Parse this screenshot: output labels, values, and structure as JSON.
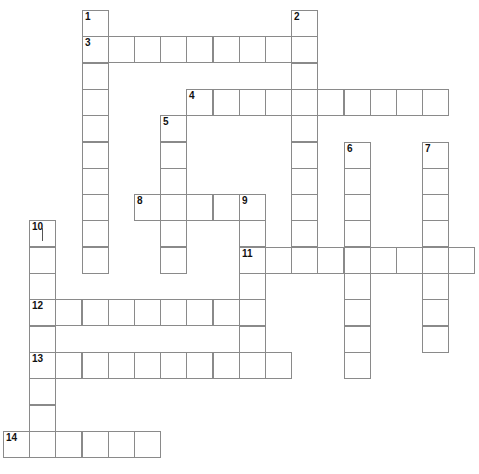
{
  "puzzle": {
    "grid": {
      "origin_x": 3,
      "origin_y": 10,
      "cell_w": 26.2,
      "cell_h": 26.3,
      "border_color": "#8a8a8a",
      "fill_color": "#ffffff"
    },
    "entries": [
      {
        "number": "1",
        "direction": "down",
        "row": 0,
        "col": 3,
        "length": 10
      },
      {
        "number": "2",
        "direction": "down",
        "row": 0,
        "col": 11,
        "length": 10
      },
      {
        "number": "3",
        "direction": "across",
        "row": 1,
        "col": 3,
        "length": 9
      },
      {
        "number": "4",
        "direction": "across",
        "row": 3,
        "col": 7,
        "length": 10
      },
      {
        "number": "5",
        "direction": "down",
        "row": 4,
        "col": 6,
        "length": 6
      },
      {
        "number": "6",
        "direction": "down",
        "row": 5,
        "col": 13,
        "length": 9
      },
      {
        "number": "7",
        "direction": "down",
        "row": 5,
        "col": 16,
        "length": 8
      },
      {
        "number": "8",
        "direction": "across",
        "row": 7,
        "col": 5,
        "length": 5
      },
      {
        "number": "9",
        "direction": "down",
        "row": 7,
        "col": 9,
        "length": 7
      },
      {
        "number": "10",
        "direction": "down",
        "row": 8,
        "col": 1,
        "length": 9
      },
      {
        "number": "11",
        "direction": "across",
        "row": 9,
        "col": 9,
        "length": 9
      },
      {
        "number": "12",
        "direction": "across",
        "row": 11,
        "col": 1,
        "length": 9
      },
      {
        "number": "13",
        "direction": "across",
        "row": 13,
        "col": 1,
        "length": 10
      },
      {
        "number": "14",
        "direction": "across",
        "row": 16,
        "col": 0,
        "length": 6
      }
    ],
    "active_cell": {
      "row": 8,
      "col": 1,
      "entry": "10"
    }
  }
}
